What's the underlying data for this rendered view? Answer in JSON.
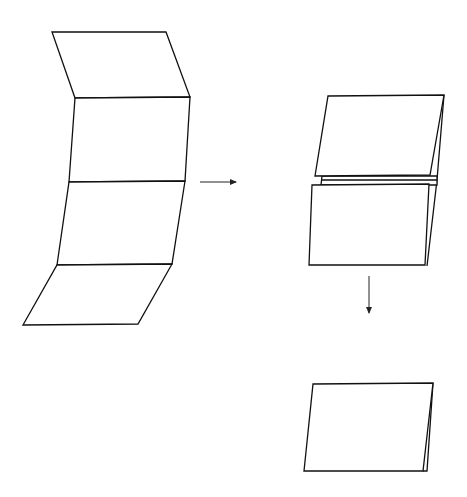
{
  "diagram": {
    "type": "paper-folding-steps",
    "steps": [
      {
        "name": "unfolded-four-panel-strip",
        "panels": 4
      },
      {
        "name": "partially-folded-stack",
        "layers": 2
      },
      {
        "name": "fully-folded-result",
        "layers": 1
      }
    ],
    "arrows": [
      {
        "direction": "right",
        "from": "step-1",
        "to": "step-2"
      },
      {
        "direction": "down",
        "from": "step-2",
        "to": "step-3"
      }
    ],
    "colors": {
      "line": "#111111",
      "background": "#ffffff"
    }
  }
}
